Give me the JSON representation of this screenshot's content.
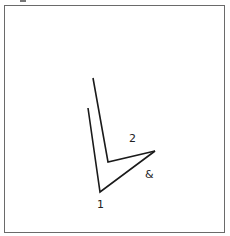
{
  "diagram": {
    "labels": {
      "one": "1",
      "two": "2",
      "ampersand": "&"
    },
    "lines": {
      "line_1": [
        [
          88,
          108
        ],
        [
          100,
          192
        ],
        [
          155,
          151
        ]
      ],
      "line_2": [
        [
          93,
          78
        ],
        [
          108,
          162
        ],
        [
          155,
          151
        ]
      ]
    },
    "colors": {
      "stroke": "#1a1a1a",
      "frame": "#6a6a6a"
    }
  }
}
